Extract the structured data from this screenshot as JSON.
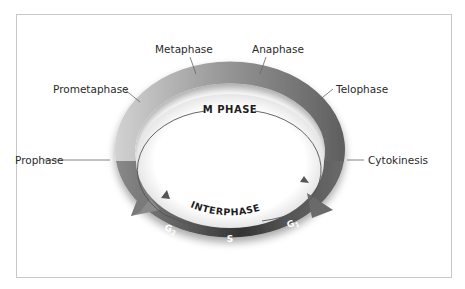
{
  "diagram": {
    "outer_cycle": {
      "label": "M PHASE",
      "stages": [
        {
          "id": "prophase",
          "label": "Prophase"
        },
        {
          "id": "prometaphase",
          "label": "Prometaphase"
        },
        {
          "id": "metaphase",
          "label": "Metaphase"
        },
        {
          "id": "anaphase",
          "label": "Anaphase"
        },
        {
          "id": "telophase",
          "label": "Telophase"
        },
        {
          "id": "cytokinesis",
          "label": "Cytokinesis"
        }
      ]
    },
    "inner_cycle": {
      "label": "INTERPHASE",
      "segments": [
        {
          "id": "g1",
          "label": "G",
          "sub": "1"
        },
        {
          "id": "s",
          "label": "S"
        },
        {
          "id": "g2",
          "label": "G",
          "sub": "2"
        }
      ]
    },
    "colors": {
      "ring_light": "#c9c9c9",
      "ring_mid": "#8c8c8c",
      "ring_dark": "#5f5f5f",
      "s_band": "#3a3a3a",
      "text": "#2a2a2a",
      "frame": "#c8c8c8"
    }
  }
}
